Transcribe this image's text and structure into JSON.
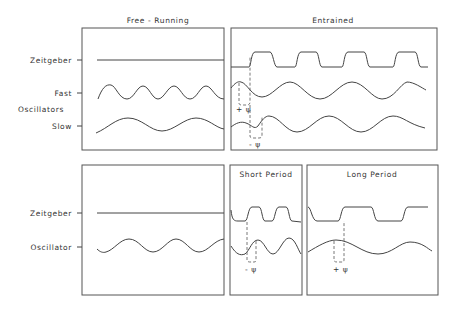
{
  "figure": {
    "top": {
      "free_running": {
        "title": "Free - Running",
        "labels": {
          "zeitgeber": "Zeitgeber",
          "fast": "Fast",
          "oscillators": "Oscillators",
          "slow": "Slow"
        },
        "zeitgeber_signal": "constant",
        "fast_oscillator_cycles": 4,
        "slow_oscillator_cycles": 2
      },
      "entrained": {
        "title": "Entrained",
        "zeitgeber_signal": "square pulses",
        "zeitgeber_cycles": 4,
        "fast_phase_label": "+ ψ",
        "slow_phase_label": "- ψ"
      }
    },
    "bottom": {
      "free_running": {
        "labels": {
          "zeitgeber": "Zeitgeber",
          "oscillator": "Oscillator"
        },
        "zeitgeber_signal": "constant",
        "oscillator_cycles": 3
      },
      "short_period": {
        "title": "Short Period",
        "phase_label": "- ψ"
      },
      "long_period": {
        "title": "Long Period",
        "phase_label": "+ ψ"
      }
    },
    "colors": {
      "line": "#444444",
      "background": "#ffffff"
    }
  }
}
